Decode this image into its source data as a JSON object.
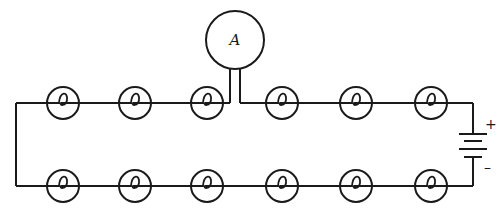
{
  "diagram": {
    "type": "series circuit",
    "ammeter": {
      "label": "A",
      "cx": 235,
      "cy": 40,
      "r": 29
    },
    "top_row_bulbs_x": [
      63,
      135,
      207,
      282,
      356,
      431
    ],
    "bottom_row_bulbs_x": [
      63,
      135,
      207,
      282,
      356,
      431
    ],
    "top_y": 103,
    "bottom_y": 186,
    "bulb_radius": 16,
    "left_x": 16,
    "right_x": 473,
    "battery": {
      "positive_label": "+",
      "negative_label": "–"
    },
    "colors": {
      "line": "#1a1a1a",
      "background": "#ffffff"
    }
  }
}
